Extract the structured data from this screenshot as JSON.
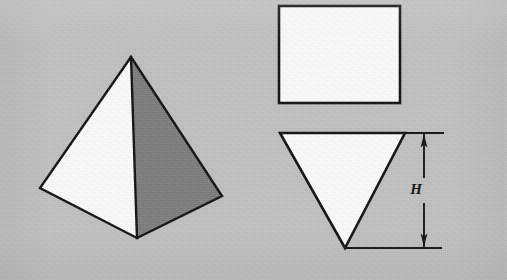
{
  "figure": {
    "kind": "orthographic-projection-diagram",
    "canvas": {
      "width": 507,
      "height": 280
    },
    "background_color": "#c2c2c2"
  },
  "colors": {
    "background": "#c2c2c2",
    "outline": "#121212",
    "face_light": "#fdfdfd",
    "face_shaded": "#7e7e7e",
    "dimension_line": "#141414",
    "label_text": "#141414"
  },
  "pictorial": {
    "name": "pyramid-pictorial-view",
    "apex": {
      "x": 131,
      "y": 57
    },
    "base_left": {
      "x": 40,
      "y": 188
    },
    "base_front": {
      "x": 137,
      "y": 238
    },
    "base_right": {
      "x": 222,
      "y": 196
    },
    "faces": [
      {
        "name": "left-face",
        "shading": "light",
        "fill": "#fdfdfd",
        "points": "131,57 40,188 137,238"
      },
      {
        "name": "right-face",
        "shading": "shaded",
        "fill": "#7e7e7e",
        "points": "131,57 137,238 222,196"
      }
    ],
    "edges": [
      {
        "name": "apex-to-left",
        "from": "131,57",
        "to": "40,188"
      },
      {
        "name": "apex-to-front",
        "from": "131,57",
        "to": "137,238"
      },
      {
        "name": "apex-to-right",
        "from": "131,57",
        "to": "222,196"
      },
      {
        "name": "left-to-front",
        "from": "40,188",
        "to": "137,238"
      },
      {
        "name": "front-to-right",
        "from": "137,238",
        "to": "222,196"
      }
    ],
    "stroke_width": 2.4
  },
  "plan_view": {
    "name": "plan-view-rectangle",
    "shape": "rectangle",
    "fill": "#fdfdfd",
    "x": 279,
    "y": 6,
    "width": 121,
    "height": 97,
    "stroke_width": 2.6
  },
  "elevation_view": {
    "name": "elevation-view-triangle",
    "shape": "inverted-triangle",
    "fill": "#fdfdfd",
    "points": "280,133 405,133 345,248",
    "top_left": {
      "x": 280,
      "y": 133
    },
    "top_right": {
      "x": 405,
      "y": 133
    },
    "bottom_vertex": {
      "x": 345,
      "y": 248
    },
    "stroke_width": 2.6
  },
  "dimension": {
    "name": "height-dimension",
    "label": "H",
    "label_meaning": "height",
    "label_position": {
      "x": 416,
      "y": 193
    },
    "dimension_line_x": 424,
    "top_y": 133,
    "bottom_y": 248,
    "arrow_style": "solid-filled-both-ends",
    "extension_lines": [
      {
        "name": "upper-extension-line",
        "x1": 405,
        "y1": 133,
        "x2": 443,
        "y2": 133
      },
      {
        "name": "lower-extension-line",
        "x1": 345,
        "y1": 248,
        "x2": 441,
        "y2": 248
      }
    ],
    "stroke_width": 2.0,
    "gap_top": 175,
    "gap_bottom": 186
  }
}
